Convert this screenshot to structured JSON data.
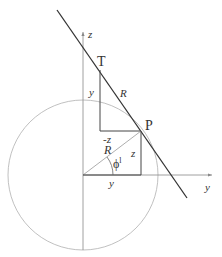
{
  "diagram": {
    "points": {
      "T": {
        "label": "T",
        "x": 100,
        "y": 68
      },
      "P": {
        "label": "P",
        "x": 141,
        "y": 131
      },
      "origin": {
        "x": 83,
        "y": 175
      }
    },
    "axes": {
      "z_label": "z",
      "y_label": "y"
    },
    "labels": {
      "tangent_R": "R",
      "radius_R": "R",
      "segment_y_upper": "y",
      "segment_y_lower": "y",
      "segment_minus_z": "-z",
      "segment_z": "z",
      "angle_phi": "ϕ",
      "angle_phi_sup": "l"
    },
    "colors": {
      "tangent_line": "#333333",
      "circle": "#b0b0b0",
      "construction": "#444444",
      "axis": "#888888"
    }
  }
}
